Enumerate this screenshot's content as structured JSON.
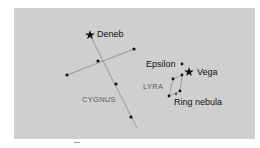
{
  "diagram": {
    "title": "",
    "background_color": "#cfcfcf",
    "line_color": "#8a8a8a",
    "star_color": "#111111",
    "constellations": [
      {
        "name": "CYGNUS",
        "stars": [
          {
            "label": "Deneb",
            "type": "bright-star",
            "x": 90,
            "y": 35
          },
          {
            "label": "",
            "type": "dot",
            "x": 98,
            "y": 61
          },
          {
            "label": "",
            "type": "dot",
            "x": 67,
            "y": 75
          },
          {
            "label": "",
            "type": "dot",
            "x": 134,
            "y": 49
          },
          {
            "label": "",
            "type": "dot",
            "x": 116,
            "y": 84
          },
          {
            "label": "",
            "type": "dot",
            "x": 131,
            "y": 117
          }
        ]
      },
      {
        "name": "LYRA",
        "stars": [
          {
            "label": "Vega",
            "type": "bright-star",
            "x": 189,
            "y": 72
          },
          {
            "label": "Epsilon",
            "type": "dot",
            "x": 182,
            "y": 64
          },
          {
            "label": "",
            "type": "dot",
            "x": 182,
            "y": 75
          },
          {
            "label": "",
            "type": "dot",
            "x": 173,
            "y": 79
          },
          {
            "label": "",
            "type": "dot",
            "x": 169,
            "y": 96
          },
          {
            "label": "",
            "type": "dot",
            "x": 180,
            "y": 91
          },
          {
            "label": "Ring nebula",
            "type": "nebula",
            "x": 176,
            "y": 94
          }
        ]
      }
    ],
    "labels": {
      "deneb": "Deneb",
      "cygnus": "CYGNUS",
      "epsilon": "Epsilon",
      "vega": "Vega",
      "lyra": "LYRA",
      "ring_nebula": "Ring nebula"
    }
  }
}
